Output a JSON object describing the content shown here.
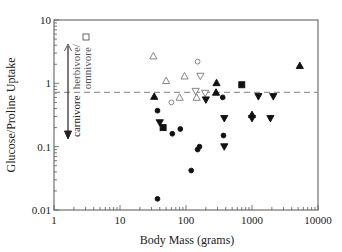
{
  "chart_data": {
    "type": "scatter",
    "title": "",
    "xlabel": "Body Mass (grams)",
    "ylabel": "Glucose/Proline Uptake",
    "xscale": "log",
    "yscale": "log",
    "xlim": [
      1,
      10000
    ],
    "ylim": [
      0.01,
      10
    ],
    "x_ticks": [
      "1",
      "10",
      "100",
      "1000",
      "10000"
    ],
    "y_ticks": [
      "0.01",
      "0.1",
      "1",
      "10"
    ],
    "grid": false,
    "reference_line": {
      "y": 0.72,
      "style": "dashed",
      "color": "#999999"
    },
    "annotations": [
      {
        "text": "herbivore/",
        "direction": "up"
      },
      {
        "text": "omnivore",
        "marker": "open-square"
      },
      {
        "text": "carnivore",
        "direction": "down"
      }
    ],
    "series": [
      {
        "name": "open-triangle-up",
        "marker": "triangle-up",
        "filled": false,
        "points": [
          [
            32,
            2.7
          ],
          [
            50,
            1.1
          ],
          [
            95,
            1.3
          ],
          [
            80,
            0.6
          ],
          [
            145,
            0.6
          ]
        ]
      },
      {
        "name": "open-triangle-down",
        "marker": "triangle-down",
        "filled": false,
        "points": [
          [
            140,
            0.75
          ],
          [
            165,
            1.3
          ],
          [
            195,
            0.7
          ]
        ]
      },
      {
        "name": "open-circle",
        "marker": "circle",
        "filled": false,
        "points": [
          [
            150,
            2.2
          ],
          [
            60,
            0.5
          ]
        ]
      },
      {
        "name": "filled-triangle-up",
        "marker": "triangle-up",
        "filled": true,
        "points": [
          [
            33,
            0.62
          ],
          [
            290,
            1.02
          ],
          [
            285,
            0.72
          ],
          [
            1000,
            0.32
          ],
          [
            5300,
            1.9
          ]
        ]
      },
      {
        "name": "filled-triangle-down",
        "marker": "triangle-down",
        "filled": true,
        "points": [
          [
            40,
            0.24
          ],
          [
            200,
            0.55
          ],
          [
            380,
            0.28
          ],
          [
            380,
            0.1
          ],
          [
            1000,
            0.28
          ],
          [
            1250,
            0.62
          ],
          [
            1900,
            0.28
          ],
          [
            2100,
            0.62
          ]
        ]
      },
      {
        "name": "filled-circle",
        "marker": "circle",
        "filled": true,
        "points": [
          [
            37,
            0.37
          ],
          [
            62,
            0.16
          ],
          [
            82,
            0.19
          ],
          [
            120,
            0.042
          ],
          [
            150,
            0.09
          ],
          [
            160,
            0.1
          ],
          [
            360,
            0.6
          ],
          [
            370,
            0.15
          ],
          [
            37,
            0.015
          ]
        ]
      },
      {
        "name": "filled-square",
        "marker": "square",
        "filled": true,
        "points": [
          [
            45,
            0.2
          ],
          [
            700,
            0.95
          ]
        ]
      }
    ]
  }
}
